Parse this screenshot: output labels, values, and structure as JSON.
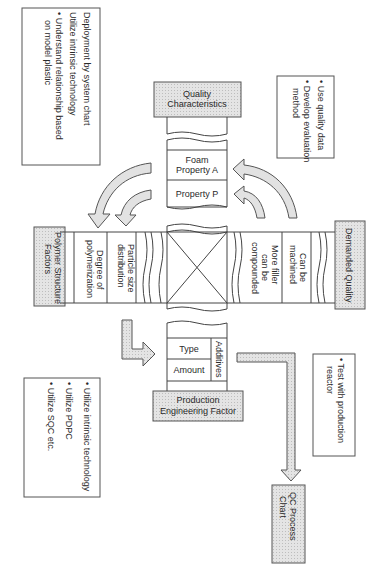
{
  "diagram": {
    "orientation": "rotated 90 degrees clockwise",
    "headers": {
      "quality_characteristics": [
        "Quality",
        "Characteristics"
      ],
      "demanded_quality": [
        "Demanded Quality"
      ],
      "polymer_structure_factors": [
        "Polymer Structure",
        "Factors"
      ],
      "production_engineering_factor": [
        "Production",
        "Engineering Factor"
      ],
      "qc_process_chart": [
        "QC Process",
        "Chart"
      ]
    },
    "top_column_items": [
      [
        "Foam",
        "Property A"
      ],
      [
        "Property P"
      ]
    ],
    "right_row_items": [
      [
        "Can be",
        "machined"
      ],
      [
        "More filler",
        "can be",
        "compounded"
      ]
    ],
    "left_row_items": [
      [
        "Particle size",
        "distribution"
      ],
      [
        "Degree of",
        "polymerization"
      ]
    ],
    "bottom_column_items": {
      "group_label": "Additives",
      "items": [
        "Type",
        "Amount"
      ]
    },
    "notes": {
      "top_left": [
        "Deployment by system chart",
        "Utilize intrinsic technology",
        "Understand relationship based on model plastic"
      ],
      "top_right": [
        "Use quality data",
        "Develop  evaluation method"
      ],
      "bottom_left": [
        "Utilize intrinsic technology",
        "Utilize PDPC",
        "Utilize SQC etc."
      ],
      "bottom_right": [
        "Test with production reactor"
      ]
    },
    "colors": {
      "header_fill": "#d9d9d9",
      "arrow_fill": "#e2e2e2",
      "line": "#444444"
    }
  }
}
